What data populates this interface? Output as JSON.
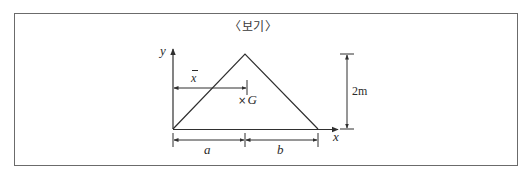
{
  "figure": {
    "title": "〈보기〉",
    "axes": {
      "x_label": "x",
      "y_label": "y"
    },
    "shape": "triangle",
    "centroid": {
      "marker": "×",
      "label": "G"
    },
    "dimensions": {
      "centroid_distance_label": "x",
      "centroid_distance_symbol": "x̄",
      "left_base_label": "a",
      "right_base_label": "b",
      "height_label": "2m"
    },
    "colors": {
      "line": "#2f2f2f",
      "frame": "#6b6b6b",
      "background": "#ffffff"
    }
  }
}
